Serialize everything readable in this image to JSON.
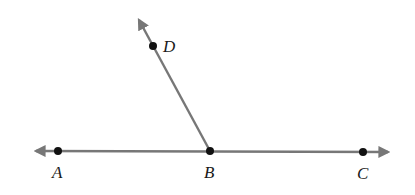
{
  "diagram": {
    "type": "geometry-angle",
    "line_color": "#777777",
    "point_color": "#111111",
    "label_color": "#1a1a1a",
    "points": {
      "A": {
        "label": "A",
        "x": 58,
        "y": 151
      },
      "B": {
        "label": "B",
        "x": 210,
        "y": 151
      },
      "C": {
        "label": "C",
        "x": 363,
        "y": 152
      },
      "D": {
        "label": "D",
        "x": 153,
        "y": 46
      }
    },
    "elements": [
      {
        "kind": "line",
        "through": [
          "A",
          "C"
        ],
        "arrows": "both"
      },
      {
        "kind": "ray",
        "from": "B",
        "through": "D",
        "arrows": "end"
      }
    ]
  }
}
